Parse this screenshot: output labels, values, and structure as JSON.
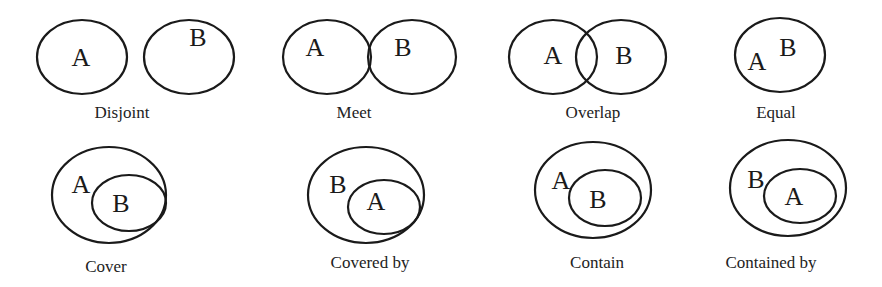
{
  "relations": [
    {
      "caption": "Disjoint",
      "caption_pos": [
        122,
        118
      ],
      "ellipses": [
        {
          "cx": 82,
          "cy": 57,
          "rx": 45,
          "ry": 37
        },
        {
          "cx": 189,
          "cy": 57,
          "rx": 45,
          "ry": 37
        }
      ],
      "labels": [
        {
          "text": "A",
          "x": 81,
          "y": 66
        },
        {
          "text": "B",
          "x": 198,
          "y": 46
        }
      ]
    },
    {
      "caption": "Meet",
      "caption_pos": [
        354,
        118
      ],
      "ellipses": [
        {
          "cx": 327,
          "cy": 57,
          "rx": 44,
          "ry": 37
        },
        {
          "cx": 412,
          "cy": 57,
          "rx": 44,
          "ry": 37
        }
      ],
      "labels": [
        {
          "text": "A",
          "x": 315,
          "y": 56
        },
        {
          "text": "B",
          "x": 403,
          "y": 56
        }
      ]
    },
    {
      "caption": "Overlap",
      "caption_pos": [
        593,
        118
      ],
      "ellipses": [
        {
          "cx": 553,
          "cy": 57,
          "rx": 44,
          "ry": 37
        },
        {
          "cx": 621,
          "cy": 57,
          "rx": 45,
          "ry": 37
        }
      ],
      "labels": [
        {
          "text": "A",
          "x": 553,
          "y": 64
        },
        {
          "text": "B",
          "x": 624,
          "y": 64
        }
      ]
    },
    {
      "caption": "Equal",
      "caption_pos": [
        776,
        118
      ],
      "ellipses": [
        {
          "cx": 780,
          "cy": 55,
          "rx": 45,
          "ry": 37
        }
      ],
      "labels": [
        {
          "text": "A",
          "x": 757,
          "y": 70
        },
        {
          "text": "B",
          "x": 788,
          "y": 56
        }
      ]
    },
    {
      "caption": "Cover",
      "caption_pos": [
        106,
        272
      ],
      "ellipses": [
        {
          "cx": 109,
          "cy": 195,
          "rx": 57,
          "ry": 48
        },
        {
          "cx": 129,
          "cy": 203,
          "rx": 37,
          "ry": 28
        }
      ],
      "labels": [
        {
          "text": "A",
          "x": 81,
          "y": 193
        },
        {
          "text": "B",
          "x": 121,
          "y": 212
        }
      ]
    },
    {
      "caption": "Covered by",
      "caption_pos": [
        370,
        268
      ],
      "ellipses": [
        {
          "cx": 366,
          "cy": 195,
          "rx": 58,
          "ry": 48
        },
        {
          "cx": 384,
          "cy": 207,
          "rx": 36,
          "ry": 27
        }
      ],
      "labels": [
        {
          "text": "B",
          "x": 338,
          "y": 193
        },
        {
          "text": "A",
          "x": 376,
          "y": 210
        }
      ]
    },
    {
      "caption": "Contain",
      "caption_pos": [
        597,
        268
      ],
      "ellipses": [
        {
          "cx": 593,
          "cy": 190,
          "rx": 58,
          "ry": 48
        },
        {
          "cx": 605,
          "cy": 198,
          "rx": 36,
          "ry": 28
        }
      ],
      "labels": [
        {
          "text": "A",
          "x": 561,
          "y": 189
        },
        {
          "text": "B",
          "x": 598,
          "y": 208
        }
      ]
    },
    {
      "caption": "Contained by",
      "caption_pos": [
        771,
        268
      ],
      "ellipses": [
        {
          "cx": 788,
          "cy": 188,
          "rx": 58,
          "ry": 48
        },
        {
          "cx": 800,
          "cy": 196,
          "rx": 36,
          "ry": 27
        }
      ],
      "labels": [
        {
          "text": "B",
          "x": 756,
          "y": 188
        },
        {
          "text": "A",
          "x": 794,
          "y": 205
        }
      ]
    }
  ]
}
